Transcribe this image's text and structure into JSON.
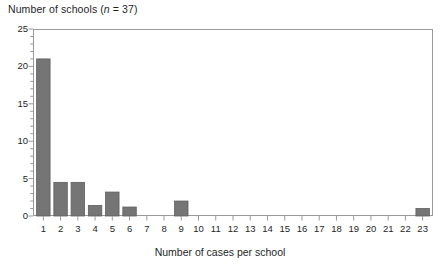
{
  "chart_data": {
    "type": "bar",
    "title": "Number of schools (n = 37)",
    "title_prefix": "Number of schools (",
    "title_italic": "n",
    "title_suffix": " = 37)",
    "xlabel": "Number of cases per school",
    "ylabel": "Number of schools",
    "categories": [
      "1",
      "2",
      "3",
      "4",
      "5",
      "6",
      "7",
      "8",
      "9",
      "10",
      "11",
      "12",
      "13",
      "14",
      "15",
      "16",
      "17",
      "18",
      "19",
      "20",
      "21",
      "22",
      "23"
    ],
    "values": [
      21,
      4.5,
      4.5,
      1.4,
      3.2,
      1.2,
      0,
      0,
      2,
      0,
      0,
      0,
      0,
      0,
      0,
      0,
      0,
      0,
      0,
      0,
      0,
      0,
      1
    ],
    "ylim": [
      0,
      25
    ],
    "xlim": [
      0.4,
      23.6
    ],
    "ytick_labels": [
      "0",
      "5",
      "10",
      "15",
      "20",
      "25"
    ],
    "ytick_values": [
      0,
      5,
      10,
      15,
      20,
      25
    ],
    "yminor_step": 1,
    "xtick_labels": [
      "1",
      "2",
      "3",
      "4",
      "5",
      "6",
      "7",
      "8",
      "9",
      "10",
      "11",
      "12",
      "13",
      "14",
      "15",
      "16",
      "17",
      "18",
      "19",
      "20",
      "21",
      "22",
      "23"
    ],
    "grid": false,
    "legend": false,
    "n": 37,
    "colors": {
      "bar_fill": "#757575",
      "bar_edge": "#5e5e5e",
      "axis": "#9a9a9a",
      "text": "#1f1f1f",
      "background": "#ffffff"
    }
  }
}
